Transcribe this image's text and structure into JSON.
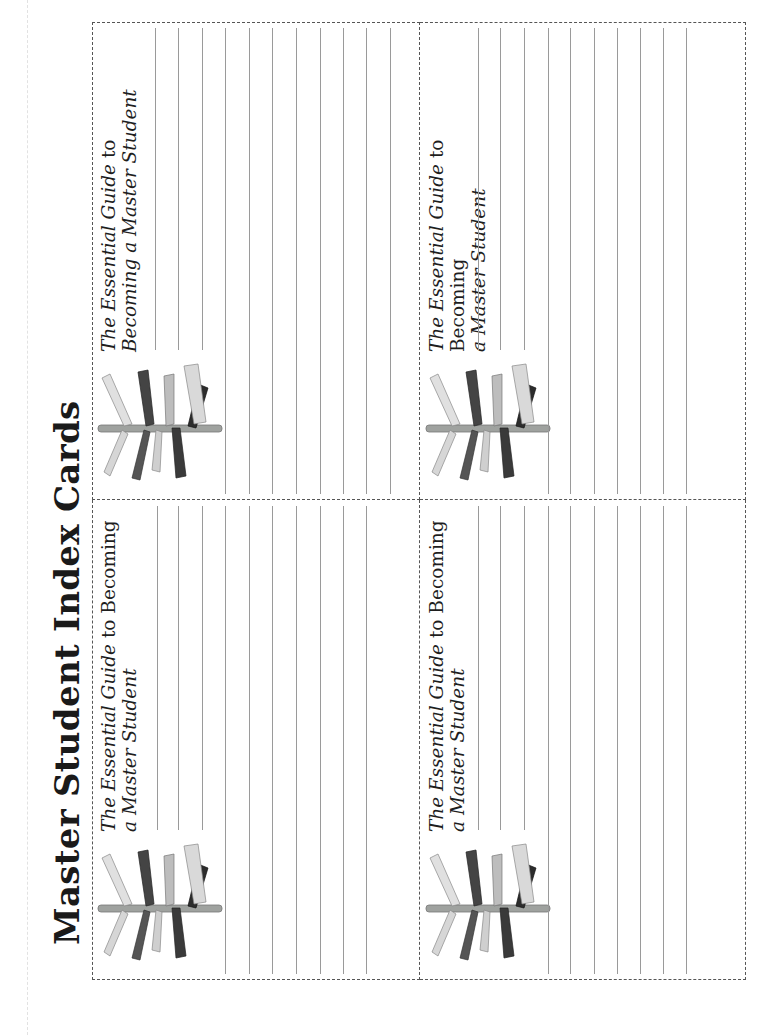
{
  "page": {
    "title": "Master Student Index Cards"
  },
  "cards": [
    {
      "id": "card-top-left",
      "heading_italic": "The Essential Guide",
      "heading_rest_line1": " to Becoming",
      "heading_line2": "a Master Student",
      "signpost_icon": "signpost-icon",
      "ruled_lines": 10
    },
    {
      "id": "card-top-right",
      "heading_italic": "The Essential Guide",
      "heading_rest_line1": " to",
      "heading_line2": "Becoming a Master Student",
      "signpost_icon": "signpost-icon",
      "ruled_lines": 11
    },
    {
      "id": "card-bottom-left",
      "heading_italic": "The Essential Guide",
      "heading_rest_line1": " to Becoming",
      "heading_line2": "a Master Student",
      "signpost_icon": "signpost-icon",
      "ruled_lines": 10
    },
    {
      "id": "card-bottom-right",
      "heading_italic": "The Essential Guide",
      "heading_rest_line1": " to Becoming",
      "heading_line2": "a Master Student",
      "signpost_icon": "signpost-icon",
      "ruled_lines": 10
    }
  ],
  "colors": {
    "dash": "#555555",
    "rule": "#9a9a9a",
    "text": "#1e1e1e"
  }
}
